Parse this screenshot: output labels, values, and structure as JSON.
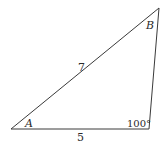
{
  "diagram": {
    "type": "triangle",
    "stroke_color": "#3a3a3a",
    "vertices": {
      "A": {
        "x": 11,
        "y": 129
      },
      "B": {
        "x": 159,
        "y": 8
      },
      "C": {
        "x": 149,
        "y": 129
      }
    },
    "labels": {
      "vertex_a": "A",
      "vertex_b": "B",
      "side_ab": "7",
      "side_ac": "5",
      "angle_c": "100°"
    }
  }
}
